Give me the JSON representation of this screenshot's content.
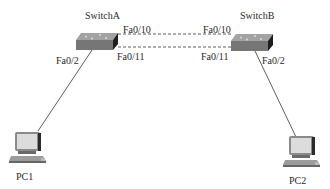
{
  "diagram": {
    "type": "network-topology",
    "nodes": {
      "switchA": {
        "label": "SwitchA",
        "kind": "switch"
      },
      "switchB": {
        "label": "SwitchB",
        "kind": "switch"
      },
      "pc1": {
        "label": "PC1",
        "kind": "pc"
      },
      "pc2": {
        "label": "PC2",
        "kind": "pc"
      }
    },
    "ports": {
      "switchA_fa010": "Fa0/10",
      "switchA_fa011": "Fa0/11",
      "switchA_fa02": "Fa0/2",
      "switchB_fa010": "Fa0/10",
      "switchB_fa011": "Fa0/11",
      "switchB_fa02": "Fa0/2"
    },
    "links": [
      {
        "from": "SwitchA Fa0/10",
        "to": "SwitchB Fa0/10",
        "style": "dashed"
      },
      {
        "from": "SwitchA Fa0/11",
        "to": "SwitchB Fa0/11",
        "style": "dashed"
      },
      {
        "from": "SwitchA Fa0/2",
        "to": "PC1",
        "style": "solid"
      },
      {
        "from": "SwitchB Fa0/2",
        "to": "PC2",
        "style": "solid"
      }
    ],
    "colors": {
      "line": "#333333",
      "switch_top": "#9a9a9a",
      "switch_side": "#6e6e6e",
      "switch_front": "#222222",
      "pc_screen": "#d8d8d8",
      "pc_body": "#8a8a8a"
    }
  }
}
